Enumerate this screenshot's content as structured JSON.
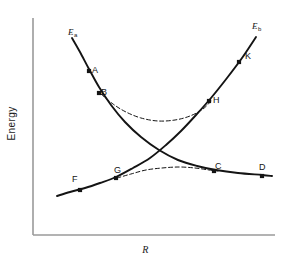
{
  "figure": {
    "type": "line-diagram",
    "background": "#ffffff",
    "ink_color": "#141414",
    "axis_color": "#8a8a8a"
  },
  "axes": {
    "x_label": "R",
    "y_label": "Energy",
    "x_ticks": [],
    "y_ticks": [],
    "grid": false,
    "origin_px": [
      33,
      235
    ],
    "x_end_px": [
      275,
      235
    ],
    "y_top_px": [
      33,
      18
    ]
  },
  "curve_labels": [
    {
      "id": "left-label",
      "base": "E",
      "sub": "a",
      "x": 68,
      "y": 28
    },
    {
      "id": "right-label",
      "base": "E",
      "sub": "b",
      "x": 252,
      "y": 22
    }
  ],
  "point_labels": [
    {
      "label": "A",
      "x": 92,
      "y": 66
    },
    {
      "label": "B",
      "x": 101,
      "y": 88
    },
    {
      "label": "C",
      "x": 215,
      "y": 162
    },
    {
      "label": "D",
      "x": 259,
      "y": 163
    },
    {
      "label": "F",
      "x": 72,
      "y": 175
    },
    {
      "label": "G",
      "x": 114,
      "y": 166
    },
    {
      "label": "H",
      "x": 213,
      "y": 96
    },
    {
      "label": "K",
      "x": 245,
      "y": 52
    }
  ],
  "chart_data": {
    "type": "line",
    "title": "",
    "xlabel": "R",
    "ylabel": "Energy",
    "grid": false,
    "legend": "none",
    "series": [
      {
        "name": "Ea",
        "style": "solid",
        "role": "diabatic-descending",
        "points_px": [
          [
            72,
            38
          ],
          [
            80,
            52
          ],
          [
            89,
            69
          ],
          [
            99,
            87
          ],
          [
            111,
            105
          ],
          [
            125,
            122
          ],
          [
            141,
            137
          ],
          [
            159,
            150
          ],
          [
            178,
            160
          ],
          [
            197,
            166
          ],
          [
            216,
            170
          ],
          [
            238,
            173
          ],
          [
            262,
            175
          ],
          [
            272,
            176
          ]
        ],
        "marked_points": [
          {
            "label": "A",
            "px": [
              89,
              71
            ]
          },
          {
            "label": "B",
            "px": [
              99,
              93
            ]
          },
          {
            "label": "C",
            "px": [
              214,
              171
            ]
          },
          {
            "label": "D",
            "px": [
              262,
              176
            ]
          }
        ]
      },
      {
        "name": "Eb",
        "style": "solid",
        "role": "diabatic-ascending",
        "points_px": [
          [
            57,
            196
          ],
          [
            70,
            192
          ],
          [
            85,
            188
          ],
          [
            100,
            183
          ],
          [
            116,
            177
          ],
          [
            133,
            168
          ],
          [
            150,
            158
          ],
          [
            166,
            145
          ],
          [
            181,
            131
          ],
          [
            196,
            115
          ],
          [
            211,
            98
          ],
          [
            227,
            78
          ],
          [
            242,
            58
          ],
          [
            256,
            37
          ]
        ],
        "marked_points": [
          {
            "label": "F",
            "px": [
              80,
              190
            ]
          },
          {
            "label": "G",
            "px": [
              116,
              178
            ]
          },
          {
            "label": "H",
            "px": [
              209,
              101
            ]
          },
          {
            "label": "K",
            "px": [
              239,
              62
            ]
          }
        ]
      },
      {
        "name": "upper-adiabatic",
        "style": "dashed",
        "role": "avoided-crossing-upper",
        "points_px": [
          [
            101,
            94
          ],
          [
            113,
            104
          ],
          [
            126,
            112
          ],
          [
            141,
            118
          ],
          [
            158,
            121
          ],
          [
            175,
            120
          ],
          [
            190,
            116
          ],
          [
            203,
            109
          ],
          [
            212,
            100
          ]
        ]
      },
      {
        "name": "lower-adiabatic",
        "style": "dashed",
        "role": "avoided-crossing-lower",
        "points_px": [
          [
            117,
            178
          ],
          [
            131,
            174
          ],
          [
            146,
            170
          ],
          [
            162,
            168
          ],
          [
            179,
            167
          ],
          [
            195,
            168
          ],
          [
            209,
            170
          ],
          [
            218,
            171
          ]
        ]
      }
    ],
    "crossing_point_px": [
      160,
      150
    ]
  }
}
